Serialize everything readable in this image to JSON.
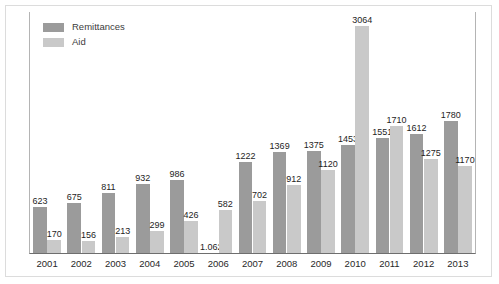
{
  "chart_data": {
    "type": "bar",
    "title": "",
    "subtitle": "",
    "xlabel": "",
    "ylabel": "",
    "grid": false,
    "legend_position": "top-left",
    "ylim": [
      0,
      3064
    ],
    "categories": [
      "2001",
      "2002",
      "2003",
      "2004",
      "2005",
      "2006",
      "2007",
      "2008",
      "2009",
      "2010",
      "2011",
      "2012",
      "2013"
    ],
    "series": [
      {
        "name": "Remittances",
        "color": "#9b9b9b",
        "values": [
          623,
          675,
          811,
          932,
          986,
          1.062,
          1222,
          1369,
          1375,
          1453,
          1551,
          1612,
          1780
        ],
        "labels": [
          "623",
          "675",
          "811",
          "932",
          "986",
          "1.062",
          "1222",
          "1369",
          "1375",
          "1453",
          "1551",
          "1612",
          "1780"
        ],
        "bar_missing": [
          false,
          false,
          false,
          false,
          false,
          true,
          false,
          false,
          false,
          false,
          false,
          false,
          false
        ]
      },
      {
        "name": "Aid",
        "color": "#c9c9c9",
        "values": [
          170,
          156,
          213,
          299,
          426,
          582,
          702,
          912,
          1120,
          3064,
          1710,
          1275,
          1170
        ],
        "labels": [
          "170",
          "156",
          "213",
          "299",
          "426",
          "582",
          "702",
          "912",
          "1120",
          "3064",
          "1710",
          "1275",
          "1170"
        ],
        "bar_missing": [
          false,
          false,
          false,
          false,
          false,
          false,
          false,
          false,
          false,
          false,
          false,
          false,
          false
        ]
      }
    ]
  },
  "legend": {
    "items": [
      {
        "label": "Remittances",
        "color": "#9b9b9b"
      },
      {
        "label": "Aid",
        "color": "#c9c9c9"
      }
    ]
  },
  "colors": {
    "remittances": "#9b9b9b",
    "aid": "#c9c9c9",
    "axis": "#6e6e6e",
    "frame": "#dcdcdc",
    "text": "#1e1e1e"
  }
}
